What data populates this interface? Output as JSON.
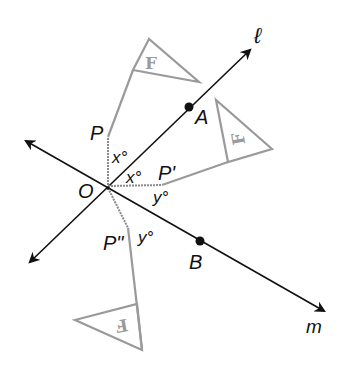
{
  "diagram": {
    "type": "geometry-reflection",
    "colors": {
      "line": "#111111",
      "figure": "#9a9a9a",
      "background": "#ffffff"
    },
    "lines": [
      {
        "name": "l",
        "label": "ℓ"
      },
      {
        "name": "m",
        "label": "m"
      }
    ],
    "points": {
      "O": "O",
      "A": "A",
      "B": "B",
      "P": "P",
      "P1": "P'",
      "P2": "P\""
    },
    "angles": {
      "x1": "x°",
      "x2": "x°",
      "y1": "y°",
      "y2": "y°"
    },
    "flags": {
      "original": "F",
      "first_image": "F",
      "second_image": "F"
    }
  }
}
